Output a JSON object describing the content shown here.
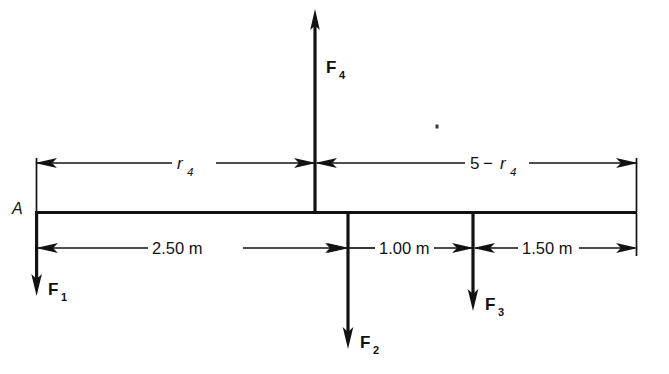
{
  "figure": {
    "kind": "free-body-diagram",
    "background_color": "#ffffff",
    "line_color": "#121212"
  },
  "beam": {
    "label": "A",
    "label_name": "point-A"
  },
  "forces": [
    {
      "id": "F1",
      "base": "F",
      "subscript": "1",
      "direction": "down",
      "position_label": "left end of beam at A"
    },
    {
      "id": "F2",
      "base": "F",
      "subscript": "2",
      "direction": "down",
      "position_label": "2.50 m from A"
    },
    {
      "id": "F3",
      "base": "F",
      "subscript": "3",
      "direction": "down",
      "position_label": "3.50 m from A"
    },
    {
      "id": "F4",
      "base": "F",
      "subscript": "4",
      "direction": "up",
      "position_label": "r4 from A"
    }
  ],
  "dimensions_upper": [
    {
      "id": "dim-r4",
      "text_parts": {
        "base": "r",
        "subscript": "4"
      },
      "full_text": "r4",
      "from": "A",
      "to": "F4"
    },
    {
      "id": "dim-5-minus-r4",
      "text_parts": {
        "lead": "5",
        "operator": "−",
        "base": "r",
        "subscript": "4"
      },
      "full_text": "5 − r4",
      "from": "F4",
      "to": "right end"
    }
  ],
  "dimensions_lower": [
    {
      "id": "dim-250",
      "text": "2.50 m",
      "from": "A",
      "to": "F2"
    },
    {
      "id": "dim-100",
      "text": "1.00 m",
      "from": "F2",
      "to": "F3"
    },
    {
      "id": "dim-150",
      "text": "1.50 m",
      "from": "F3",
      "to": "right end"
    }
  ]
}
